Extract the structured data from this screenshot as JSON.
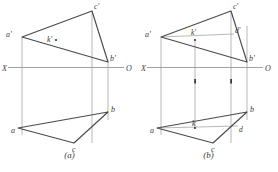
{
  "figures": [
    {
      "id": "figure-a",
      "caption": "(a)",
      "axis": {
        "left_label": "X",
        "right_label": "O"
      },
      "labels": {
        "a_prime": "a'",
        "b_prime": "b'",
        "c_prime": "c'",
        "k_prime": "k'",
        "a": "a",
        "b": "b",
        "c": "c"
      }
    },
    {
      "id": "figure-b",
      "caption": "(b)",
      "axis": {
        "left_label": "X",
        "right_label": "O"
      },
      "labels": {
        "a_prime": "a'",
        "b_prime": "b'",
        "c_prime": "c'",
        "k_prime": "k'",
        "d_prime": "d'",
        "a": "a",
        "b": "b",
        "c": "c",
        "d": "d",
        "k": "k"
      }
    }
  ],
  "style": {
    "line_color": "#4a4a4a",
    "thin_line_color": "#9a9a9a",
    "axis_color": "#8a8a8a",
    "label_color": "#3b3b3b",
    "background": "#ffffff"
  }
}
